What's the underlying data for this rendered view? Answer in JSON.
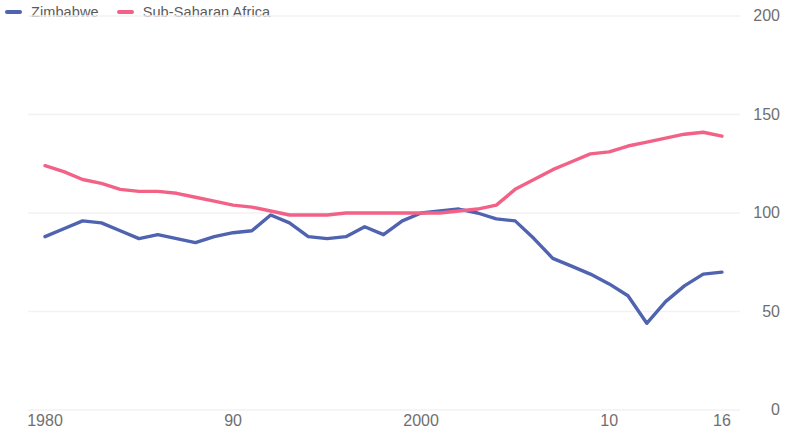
{
  "legend": {
    "position": "top-left",
    "items": [
      {
        "label": "Zimbabwe",
        "color": "#4f63b0",
        "icon": "line-swatch-icon"
      },
      {
        "label": "Sub-Saharan Africa",
        "color": "#f26287",
        "icon": "line-swatch-icon"
      }
    ]
  },
  "axes": {
    "y_ticks": [
      "200",
      "150",
      "100",
      "50",
      "0"
    ],
    "x_ticks": [
      "1980",
      "90",
      "2000",
      "10",
      "16"
    ]
  },
  "chart_data": {
    "type": "line",
    "title": "",
    "subtitle": "",
    "xlabel": "",
    "ylabel": "",
    "xlim": [
      1980,
      2016
    ],
    "ylim": [
      0,
      200
    ],
    "grid": true,
    "grid_axis": "y",
    "legend_position": "top-left",
    "x": [
      1980,
      1981,
      1982,
      1983,
      1984,
      1985,
      1986,
      1987,
      1988,
      1989,
      1990,
      1991,
      1992,
      1993,
      1994,
      1995,
      1996,
      1997,
      1998,
      1999,
      2000,
      2001,
      2002,
      2003,
      2004,
      2005,
      2006,
      2007,
      2008,
      2009,
      2010,
      2011,
      2012,
      2013,
      2014,
      2015,
      2016
    ],
    "x_tick_values": [
      1980,
      1990,
      2000,
      2010,
      2016
    ],
    "x_tick_labels": [
      "1980",
      "90",
      "2000",
      "10",
      "16"
    ],
    "y_tick_values": [
      0,
      50,
      100,
      150,
      200
    ],
    "y_tick_labels": [
      "0",
      "50",
      "100",
      "150",
      "200"
    ],
    "series": [
      {
        "name": "Zimbabwe",
        "color": "#4f63b0",
        "values": [
          88,
          92,
          96,
          95,
          91,
          87,
          89,
          87,
          85,
          88,
          90,
          91,
          99,
          95,
          88,
          87,
          88,
          93,
          89,
          96,
          100,
          101,
          102,
          100,
          97,
          96,
          87,
          77,
          73,
          69,
          64,
          58,
          44,
          55,
          63,
          69,
          70
        ]
      },
      {
        "name": "Sub-Saharan Africa",
        "color": "#f26287",
        "values": [
          124,
          121,
          117,
          115,
          112,
          111,
          111,
          110,
          108,
          106,
          104,
          103,
          101,
          99,
          99,
          99,
          100,
          100,
          100,
          100,
          100,
          100,
          101,
          102,
          104,
          112,
          117,
          122,
          126,
          130,
          131,
          134,
          136,
          138,
          140,
          141,
          139
        ]
      }
    ]
  }
}
